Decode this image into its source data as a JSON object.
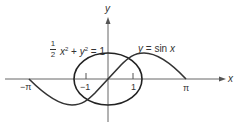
{
  "diagram": {
    "axes": {
      "x_label": "x",
      "y_label": "y"
    },
    "ticks": {
      "neg_pi": "−π",
      "neg_one": "−1",
      "one": "1",
      "pi": "π"
    },
    "ellipse_equation": {
      "frac_num": "1",
      "frac_den": "2",
      "x_var": "x",
      "exp1": "2",
      "plus": " + ",
      "y_var": "y",
      "exp2": "2",
      "rhs": " = 1"
    },
    "sine_equation": {
      "lhs": "y",
      "rhs": " = sin ",
      "var": "x"
    },
    "colors": {
      "axis": "#555555",
      "curve": "#333333",
      "text": "#333333"
    }
  }
}
